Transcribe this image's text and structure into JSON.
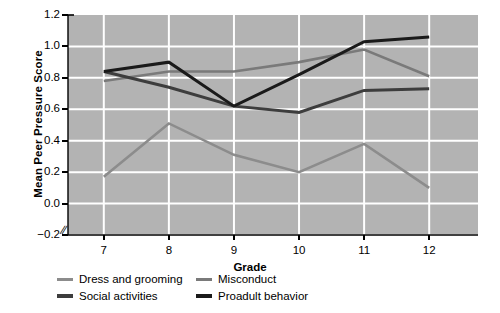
{
  "chart_data": {
    "type": "line",
    "title": "",
    "xlabel": "Grade",
    "ylabel": "Mean Peer Pressure Score",
    "categories": [
      7,
      8,
      9,
      10,
      11,
      12
    ],
    "xlim": [
      6.45,
      12.75
    ],
    "ylim": [
      -0.2,
      1.2
    ],
    "yticks": [
      -0.2,
      0.0,
      0.2,
      0.4,
      0.6,
      0.8,
      1.0,
      1.2
    ],
    "ytick_labels": [
      "−0.2",
      "0.0",
      "0.2",
      "0.4",
      "0.6",
      "0.8",
      "1.0",
      "1.2"
    ],
    "xtick_labels": [
      "7",
      "8",
      "9",
      "10",
      "11",
      "12"
    ],
    "grid": true,
    "grid_color": "#ffffff",
    "plot_background": "#b3b3b3",
    "legend_position": "below",
    "axis_break_y": true,
    "series": [
      {
        "name": "Dress and grooming",
        "color": "#8c8c8c",
        "values": [
          0.17,
          0.51,
          0.31,
          0.2,
          0.38,
          0.1
        ]
      },
      {
        "name": "Misconduct",
        "color": "#7a7a7a",
        "values": [
          0.78,
          0.84,
          0.84,
          0.9,
          0.98,
          0.81
        ]
      },
      {
        "name": "Social activities",
        "color": "#3d3d3d",
        "values": [
          0.84,
          0.74,
          0.62,
          0.58,
          0.72,
          0.73
        ]
      },
      {
        "name": "Proadult behavior",
        "color": "#1a1a1a",
        "values": [
          0.84,
          0.9,
          0.62,
          0.82,
          1.03,
          1.06
        ]
      }
    ]
  },
  "legend": {
    "entries": [
      {
        "label": "Dress and grooming"
      },
      {
        "label": "Misconduct"
      },
      {
        "label": "Social activities"
      },
      {
        "label": "Proadult behavior"
      }
    ]
  }
}
